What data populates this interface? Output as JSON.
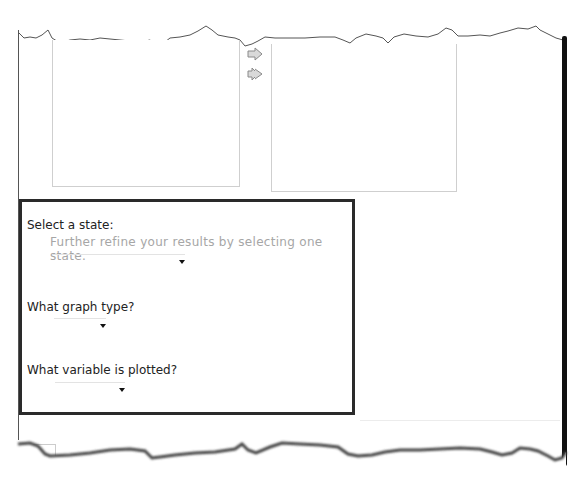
{
  "transfer": {
    "available_list": {
      "items": []
    },
    "selected_list": {
      "items": []
    },
    "buttons": [
      {
        "icon": "arrow-right-icon",
        "action": "add-selected"
      },
      {
        "icon": "double-arrow-right-icon",
        "action": "add-all"
      }
    ]
  },
  "options": {
    "state": {
      "label": "Select a state:",
      "hint": "Further refine your results by selecting one state.",
      "value": ""
    },
    "graph_type": {
      "label": "What graph type?",
      "value": ""
    },
    "variable": {
      "label": "What variable is plotted?",
      "value": ""
    }
  },
  "colors": {
    "panel_border": "#2a2a2a",
    "hint_text": "#a6a6a6",
    "list_border": "#cfcfcf"
  }
}
